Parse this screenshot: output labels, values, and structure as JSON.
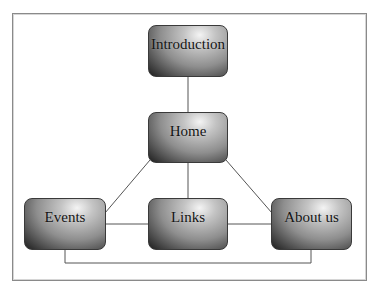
{
  "diagram": {
    "type": "site-map",
    "nodes": [
      {
        "id": "introduction",
        "label": "Introduction"
      },
      {
        "id": "home",
        "label": "Home"
      },
      {
        "id": "events",
        "label": "Events"
      },
      {
        "id": "links",
        "label": "Links"
      },
      {
        "id": "about",
        "label": "About us"
      }
    ],
    "edges": [
      {
        "from": "introduction",
        "to": "home"
      },
      {
        "from": "home",
        "to": "events"
      },
      {
        "from": "home",
        "to": "links"
      },
      {
        "from": "home",
        "to": "about"
      },
      {
        "from": "events",
        "to": "links"
      },
      {
        "from": "links",
        "to": "about"
      },
      {
        "from": "events",
        "to": "about"
      }
    ]
  },
  "colors": {
    "line": "#555555",
    "frame": "#8a8a8a",
    "node_dark": "#1e1e1e",
    "node_light": "#f4f4f4"
  }
}
